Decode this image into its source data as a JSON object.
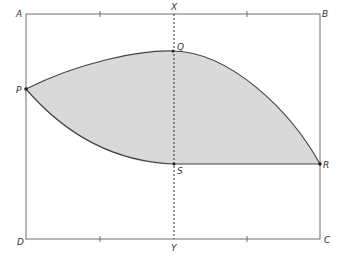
{
  "diagram": {
    "title": "",
    "colors": {
      "frame": "#6e6e6e",
      "curve": "#444444",
      "fill": "#d9d9d9",
      "dashed": "#333333",
      "text": "#333333"
    },
    "rectangle": {
      "corners": {
        "A": [
          26,
          14
        ],
        "B": [
          320,
          14
        ],
        "C": [
          320,
          239
        ],
        "D": [
          26,
          239
        ]
      }
    },
    "points": {
      "P": [
        26,
        89
      ],
      "Q": [
        173,
        51
      ],
      "R": [
        320,
        164
      ],
      "S": [
        174,
        164
      ],
      "X": [
        174,
        14
      ],
      "Y": [
        174,
        239
      ]
    },
    "labels": {
      "A": "A",
      "B": "B",
      "C": "C",
      "D": "D",
      "P": "P",
      "Q": "Q",
      "R": "R",
      "S": "S",
      "X": "X",
      "Y": "Y"
    },
    "tick_marks": {
      "top": [
        100,
        247
      ],
      "bottom": [
        100,
        247
      ]
    },
    "shaded_region": "Region bounded by curve P–Q–R (top), segment R–S and curve S–P (bottom)",
    "dashed_line": "XY vertical through Q and S"
  }
}
